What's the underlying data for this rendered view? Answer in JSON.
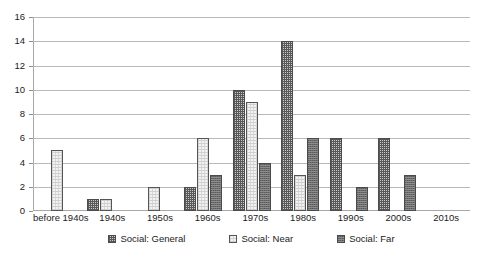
{
  "chart_data": {
    "type": "bar",
    "title": "",
    "subtitle": "",
    "xlabel": "",
    "ylabel": "",
    "ylim": [
      0,
      16
    ],
    "ytick_step": 2,
    "yticks": [
      16,
      14,
      12,
      10,
      8,
      6,
      4,
      2,
      0
    ],
    "grid": true,
    "legend_position": "bottom",
    "categories": [
      "before 1940s",
      "1940s",
      "1950s",
      "1960s",
      "1970s",
      "1980s",
      "1990s",
      "2000s",
      "2010s"
    ],
    "series": [
      {
        "name": "Social: General",
        "pattern": "cross-hatch",
        "color": "#595959",
        "values": [
          0,
          1,
          0,
          2,
          10,
          14,
          6,
          6,
          0
        ]
      },
      {
        "name": "Social: Near",
        "pattern": "light-dotted",
        "color": "#f2f2f2",
        "values": [
          5,
          1,
          2,
          6,
          9,
          3,
          0,
          0,
          0
        ]
      },
      {
        "name": "Social: Far",
        "pattern": "dark-speckle",
        "color": "#6f6f6f",
        "values": [
          0,
          0,
          0,
          3,
          4,
          6,
          2,
          3,
          0
        ]
      }
    ]
  }
}
